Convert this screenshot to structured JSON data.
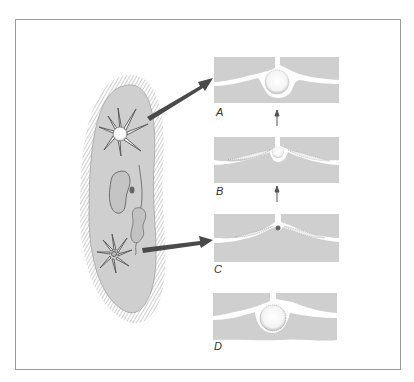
{
  "figure": {
    "colors": {
      "cytoplasm": "#cfcfcf",
      "arrow": "#4a4a4a",
      "frame": "#9a9a9a",
      "cilia": "#8a8a8a",
      "vacuole": "#ffffff"
    },
    "panels": [
      {
        "id": "A",
        "label": "A",
        "stage": "vacuole full, canals collapsed"
      },
      {
        "id": "B",
        "label": "B",
        "stage": "vacuole emptying, canals filling"
      },
      {
        "id": "C",
        "label": "C",
        "stage": "vacuole emptied, canals full"
      },
      {
        "id": "D",
        "label": "D",
        "stage": "vacuole refilled"
      }
    ],
    "arrows": [
      {
        "from": "upper-vacuole",
        "to": "A"
      },
      {
        "from": "lower-vacuole",
        "to": "C"
      },
      {
        "from": "B",
        "to": "A",
        "type": "sequence"
      },
      {
        "from": "C",
        "to": "B",
        "type": "sequence"
      }
    ]
  }
}
